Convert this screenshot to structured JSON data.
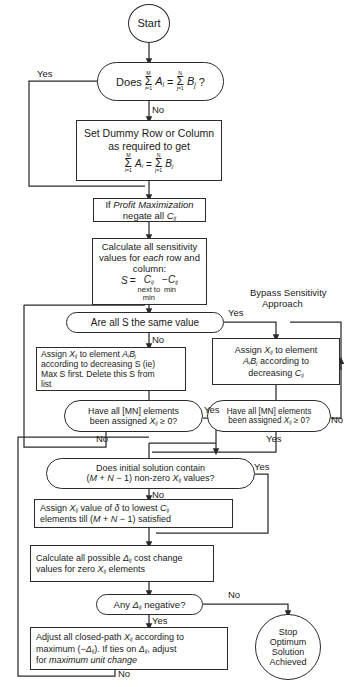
{
  "diagram": {
    "type": "flowchart",
    "stroke_color": "#2b2b2b",
    "background": "#ffffff"
  },
  "nodes": {
    "start": {
      "shape": "circle",
      "label": "Start"
    },
    "check_balance": {
      "shape": "pill",
      "text_prefix": "Does",
      "sum_left": {
        "upper": "M",
        "sigma": "Σ",
        "lower": "i=1",
        "term": "A",
        "sub": "i"
      },
      "equals": "=",
      "sum_right": {
        "upper": "N",
        "sigma": "Σ",
        "lower": "j=1",
        "term": "B",
        "sub": "j"
      },
      "suffix": "?"
    },
    "set_dummy": {
      "shape": "rect",
      "line1": "Set Dummy Row or Column",
      "line2": "as required to get",
      "sum_left": {
        "upper": "M",
        "sigma": "Σ",
        "lower": "i=1",
        "term": "A",
        "sub": "i"
      },
      "equals": "=",
      "sum_right": {
        "upper": "N",
        "sigma": "Σ",
        "lower": "j=1",
        "term": "B",
        "sub": "j"
      }
    },
    "profit_max": {
      "shape": "rect",
      "line1_plain": "If ",
      "line1_italic": "Profit Maximization",
      "line2_plain": "negate all ",
      "line2_term": "C",
      "line2_sub": "ij"
    },
    "calc_sensitivity": {
      "shape": "rect",
      "line1": "Calculate all sensitivity",
      "line2_a": "values for ",
      "line2_italic": "each",
      "line2_b": " row and",
      "line3": "column:",
      "formula": {
        "s": "S",
        "eq": "=",
        "term1": "C",
        "term1_sub": "ij",
        "term1_under1": "next to",
        "term1_under2": "min",
        "minus": "−",
        "term2": "C",
        "term2_sub": "ij",
        "term2_under": "min"
      }
    },
    "all_s_same": {
      "shape": "pill",
      "label": "Are all S the same value"
    },
    "assign_by_s": {
      "shape": "rect",
      "line1_a": "Assign ",
      "line1_x": "X",
      "line1_xsub": "ij",
      "line1_b": " to element ",
      "line1_c": "A",
      "line1_csub": "i",
      "line1_d": "B",
      "line1_dsub": "j",
      "line2": "according to decreasing S (ie)",
      "line3": "Max S first. Delete this S from",
      "line4": "list"
    },
    "assign_by_c": {
      "shape": "rect",
      "line1_a": "Assign ",
      "line1_x": "X",
      "line1_xsub": "ij",
      "line1_b": " to element",
      "line2_a": "A",
      "line2_asub": "i",
      "line2_b": "B",
      "line2_bsub": "j",
      "line2_c": " according to",
      "line3_a": "decreasing ",
      "line3_c": "C",
      "line3_csub": "ij"
    },
    "all_assigned_left": {
      "shape": "pill",
      "line1": "Have all [MN] elements",
      "line2_a": "been assigned ",
      "line2_x": "X",
      "line2_xsub": "ij",
      "line2_b": " ≥ 0?"
    },
    "all_assigned_right": {
      "shape": "pill",
      "line1": "Have all [MN] elements",
      "line2_a": "been assigned ",
      "line2_x": "X",
      "line2_xsub": "ij",
      "line2_b": " ≥ 0?"
    },
    "degeneracy_check": {
      "shape": "pill",
      "line1": "Does initial solution contain",
      "line2_a": "(",
      "line2_m": "M",
      "line2_p": " + ",
      "line2_n": "N",
      "line2_q": " − 1) non-zero ",
      "line2_x": "X",
      "line2_xsub": "ij",
      "line2_b": " values?"
    },
    "assign_delta": {
      "shape": "rect",
      "line1_a": "Assign ",
      "line1_x": "X",
      "line1_xsub": "ij",
      "line1_b": " value of ",
      "line1_delta": "δ",
      "line1_c": " to lowest ",
      "line1_cc": "C",
      "line1_ccsub": "ij",
      "line2_a": "elements till (",
      "line2_m": "M",
      "line2_p": " + ",
      "line2_n": "N",
      "line2_b": " − 1) satisfied"
    },
    "calc_deltas": {
      "shape": "rect",
      "line1_a": "Calculate all possible ",
      "line1_d": "Δ",
      "line1_dsub": "ij",
      "line1_b": " cost change",
      "line2_a": "values for zero ",
      "line2_x": "X",
      "line2_xsub": "ij",
      "line2_b": " elements"
    },
    "any_negative": {
      "shape": "pill",
      "line_a": "Any ",
      "line_d": "Δ",
      "line_dsub": "ij",
      "line_b": " negative?"
    },
    "adjust_path": {
      "shape": "rect",
      "line1_a": "Adjust all closed-path ",
      "line1_x": "X",
      "line1_xsub": "ij",
      "line1_b": " according to",
      "line2_a": "maximum (−",
      "line2_d": "Δ",
      "line2_dsub": "ij",
      "line2_b": "). If ties on ",
      "line2_d2": "Δ",
      "line2_d2sub": "ij",
      "line2_c": ", adjust",
      "line3_a": "for ",
      "line3_italic": "maximum unit change"
    },
    "stop": {
      "shape": "circle",
      "line1": "Stop",
      "line2": "Optimum",
      "line3": "Solution",
      "line4": "Achieved"
    }
  },
  "edge_labels": {
    "yes_balance": "Yes",
    "no_balance": "No",
    "yes_all_s": "Yes",
    "no_all_s": "No",
    "bypass_line1": "Bypass Sensitivity",
    "bypass_line2": "Approach",
    "yes_assigned_left": "Yes",
    "no_assigned_left": "No",
    "no_assigned_right": "No",
    "yes_assigned_right": "Yes",
    "yes_degeneracy": "Yes",
    "no_degeneracy": "No",
    "no_negative": "No",
    "yes_negative": "Yes",
    "no_loopback": "No"
  }
}
